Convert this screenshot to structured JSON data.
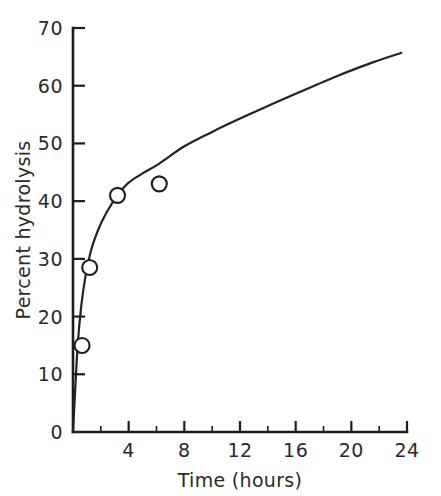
{
  "chart_data": {
    "type": "line",
    "title": "",
    "subtitle": "",
    "xlabel": "Time (hours)",
    "ylabel": "Percent hydrolysis",
    "xlim": [
      0,
      24
    ],
    "ylim": [
      0,
      70
    ],
    "grid": false,
    "legend": null,
    "x_ticks_major": [
      0,
      4,
      8,
      12,
      16,
      20,
      24
    ],
    "x_tick_labels": [
      "0",
      "4",
      "8",
      "12",
      "16",
      "20",
      "24"
    ],
    "x_ticks_minor": [
      2,
      6,
      10,
      14,
      18,
      22
    ],
    "y_ticks_major": [
      0,
      10,
      20,
      30,
      40,
      50,
      60,
      70
    ],
    "y_tick_labels": [
      "0",
      "10",
      "20",
      "30",
      "40",
      "50",
      "60",
      "70"
    ],
    "series": [
      {
        "name": "hydrolysis-curve",
        "kind": "line",
        "x": [
          0.0,
          0.15,
          0.35,
          0.6,
          0.9,
          1.3,
          1.8,
          2.4,
          3.2,
          4.0,
          5.0,
          6.2,
          8.0,
          10.0,
          12.0,
          14.0,
          16.0,
          19.0,
          21.5,
          23.6
        ],
        "y": [
          0.0,
          7.0,
          15.5,
          22.0,
          27.0,
          31.5,
          35.0,
          38.0,
          41.0,
          43.2,
          44.8,
          46.5,
          49.5,
          52.0,
          54.3,
          56.5,
          58.6,
          61.7,
          64.0,
          65.7
        ]
      },
      {
        "name": "data-points",
        "kind": "scatter",
        "marker": "open-circle",
        "x": [
          0.65,
          1.2,
          3.2,
          6.2
        ],
        "y": [
          15.0,
          28.5,
          41.0,
          43.0
        ]
      }
    ],
    "colors": {
      "curve": "#222222",
      "marker_fill": "#ffffff",
      "marker_stroke": "#1d1d1d",
      "axis": "#1d1d1d",
      "text": "#2a2a2a",
      "background": "#ffffff"
    }
  },
  "geometry": {
    "origin_x_px": 73,
    "origin_y_px": 432,
    "x_max_px": 407,
    "y_max_px": 28
  }
}
